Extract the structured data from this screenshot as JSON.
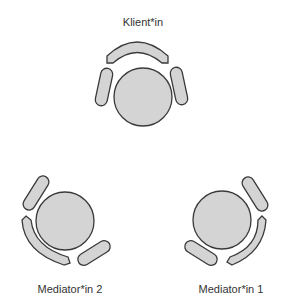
{
  "diagram": {
    "title": "",
    "colors": {
      "fill": "#d4d4d4",
      "stroke": "#3a3a3a",
      "text": "#333333"
    },
    "seats": [
      {
        "id": "klient",
        "label": "Klient*in"
      },
      {
        "id": "mediator2",
        "label": "Mediator*in 2"
      },
      {
        "id": "mediator1",
        "label": "Mediator*in 1"
      }
    ]
  }
}
